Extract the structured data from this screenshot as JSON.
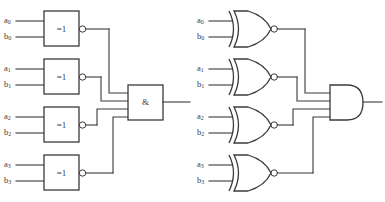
{
  "diagram": {
    "stroke_color": "#3a3a3a",
    "background_color": "#ffffff",
    "variants": [
      {
        "id": "iec",
        "notation": "rectangular",
        "xnor_label": "=1",
        "and_label": "&"
      },
      {
        "id": "ansi",
        "notation": "distinctive-shape",
        "xnor_label": "",
        "and_label": ""
      }
    ],
    "xnor_gates": [
      {
        "label": "=1",
        "inputs": [
          {
            "name": "a",
            "sub": "0"
          },
          {
            "name": "b",
            "sub": "0"
          }
        ],
        "inverted_output": true
      },
      {
        "label": "=1",
        "inputs": [
          {
            "name": "a",
            "sub": "1"
          },
          {
            "name": "b",
            "sub": "1"
          }
        ],
        "inverted_output": true
      },
      {
        "label": "=1",
        "inputs": [
          {
            "name": "a",
            "sub": "2"
          },
          {
            "name": "b",
            "sub": "2"
          }
        ],
        "inverted_output": true
      },
      {
        "label": "=1",
        "inputs": [
          {
            "name": "a",
            "sub": "3"
          },
          {
            "name": "b",
            "sub": "3"
          }
        ],
        "inverted_output": true
      }
    ],
    "and_gate": {
      "label": "&",
      "input_count": 4,
      "inverted_output": false
    }
  },
  "left": {
    "gate0": {
      "label": "=1",
      "a": "a",
      "a_sub": "0",
      "b": "b",
      "b_sub": "0"
    },
    "gate1": {
      "label": "=1",
      "a": "a",
      "a_sub": "1",
      "b": "b",
      "b_sub": "1"
    },
    "gate2": {
      "label": "=1",
      "a": "a",
      "a_sub": "2",
      "b": "b",
      "b_sub": "2"
    },
    "gate3": {
      "label": "=1",
      "a": "a",
      "a_sub": "3",
      "b": "b",
      "b_sub": "3"
    },
    "and": {
      "label": "&"
    }
  },
  "right": {
    "gate0": {
      "a": "a",
      "a_sub": "0",
      "b": "b",
      "b_sub": "0"
    },
    "gate1": {
      "a": "a",
      "a_sub": "1",
      "b": "b",
      "b_sub": "1"
    },
    "gate2": {
      "a": "a",
      "a_sub": "2",
      "b": "b",
      "b_sub": "2"
    },
    "gate3": {
      "a": "a",
      "a_sub": "3",
      "b": "b",
      "b_sub": "3"
    },
    "and": {
      "label": ""
    }
  }
}
